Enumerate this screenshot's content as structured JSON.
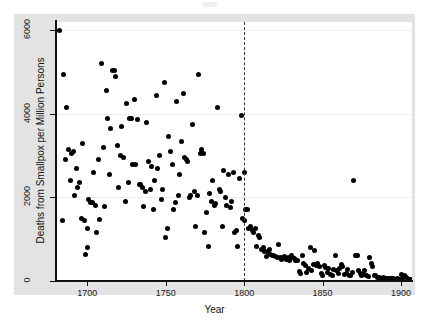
{
  "chart_data": {
    "type": "scatter",
    "title": "",
    "xlabel": "Year",
    "ylabel": "Deaths from Smallpox per Million Persons",
    "xlim": [
      1680,
      1907
    ],
    "ylim": [
      0,
      6200
    ],
    "xticks": [
      1700,
      1750,
      1800,
      1850,
      1900
    ],
    "xticklabels": [
      "1700",
      "1750",
      "1800",
      "1850",
      "1900"
    ],
    "yticks": [
      0,
      2000,
      4000,
      6000
    ],
    "yticklabels": [
      "0",
      "2000",
      "4000",
      "6000"
    ],
    "grid": "horizontal-only",
    "legend": "none",
    "marker": {
      "shape": "circle",
      "color": "#000000",
      "size": 5
    },
    "annotations": [
      {
        "type": "vline",
        "x": 1800,
        "style": "dashed",
        "color": "#333333",
        "label": ""
      }
    ],
    "points": [
      [
        1682,
        6000
      ],
      [
        1684,
        1450
      ],
      [
        1685,
        4950
      ],
      [
        1686,
        2900
      ],
      [
        1687,
        4150
      ],
      [
        1688,
        3150
      ],
      [
        1689,
        2400
      ],
      [
        1690,
        3050
      ],
      [
        1691,
        3100
      ],
      [
        1692,
        2050
      ],
      [
        1693,
        2700
      ],
      [
        1694,
        2250
      ],
      [
        1695,
        2350
      ],
      [
        1696,
        1500
      ],
      [
        1697,
        3300
      ],
      [
        1698,
        1450
      ],
      [
        1699,
        640
      ],
      [
        1700,
        1250
      ],
      [
        1700,
        810
      ],
      [
        1701,
        1950
      ],
      [
        1702,
        1880
      ],
      [
        1703,
        1880
      ],
      [
        1704,
        2600
      ],
      [
        1705,
        1800
      ],
      [
        1706,
        1150
      ],
      [
        1707,
        2900
      ],
      [
        1708,
        1480
      ],
      [
        1709,
        5200
      ],
      [
        1710,
        3200
      ],
      [
        1711,
        1780
      ],
      [
        1712,
        4550
      ],
      [
        1713,
        3900
      ],
      [
        1714,
        2550
      ],
      [
        1715,
        3650
      ],
      [
        1716,
        5050
      ],
      [
        1717,
        5050
      ],
      [
        1718,
        4900
      ],
      [
        1719,
        3250
      ],
      [
        1720,
        2250
      ],
      [
        1721,
        3000
      ],
      [
        1722,
        3700
      ],
      [
        1723,
        2950
      ],
      [
        1724,
        1900
      ],
      [
        1725,
        4250
      ],
      [
        1726,
        2350
      ],
      [
        1727,
        3900
      ],
      [
        1728,
        3900
      ],
      [
        1729,
        2800
      ],
      [
        1730,
        4350
      ],
      [
        1731,
        2800
      ],
      [
        1732,
        3870
      ],
      [
        1733,
        2300
      ],
      [
        1734,
        2300
      ],
      [
        1735,
        2250
      ],
      [
        1736,
        1780
      ],
      [
        1737,
        2150
      ],
      [
        1738,
        3800
      ],
      [
        1739,
        2850
      ],
      [
        1740,
        2200
      ],
      [
        1741,
        2750
      ],
      [
        1742,
        1700
      ],
      [
        1743,
        2400
      ],
      [
        1744,
        4450
      ],
      [
        1745,
        2700
      ],
      [
        1746,
        3000
      ],
      [
        1747,
        1950
      ],
      [
        1748,
        2200
      ],
      [
        1749,
        4750
      ],
      [
        1750,
        1050
      ],
      [
        1751,
        1250
      ],
      [
        1752,
        3450
      ],
      [
        1753,
        3100
      ],
      [
        1754,
        2800
      ],
      [
        1755,
        1720
      ],
      [
        1756,
        1880
      ],
      [
        1757,
        4300
      ],
      [
        1758,
        2050
      ],
      [
        1759,
        2550
      ],
      [
        1760,
        3350
      ],
      [
        1761,
        4500
      ],
      [
        1762,
        2950
      ],
      [
        1763,
        2900
      ],
      [
        1764,
        2850
      ],
      [
        1765,
        2000
      ],
      [
        1766,
        2050
      ],
      [
        1767,
        3750
      ],
      [
        1768,
        2150
      ],
      [
        1769,
        1300
      ],
      [
        1770,
        2050
      ],
      [
        1771,
        4950
      ],
      [
        1772,
        3050
      ],
      [
        1773,
        3150
      ],
      [
        1774,
        3050
      ],
      [
        1775,
        1150
      ],
      [
        1776,
        1650
      ],
      [
        1777,
        820
      ],
      [
        1778,
        2100
      ],
      [
        1779,
        1900
      ],
      [
        1780,
        2400
      ],
      [
        1781,
        1800
      ],
      [
        1782,
        1850
      ],
      [
        1783,
        4150
      ],
      [
        1784,
        2200
      ],
      [
        1785,
        2150
      ],
      [
        1786,
        1300
      ],
      [
        1787,
        2650
      ],
      [
        1788,
        2000
      ],
      [
        1789,
        1800
      ],
      [
        1790,
        2550
      ],
      [
        1791,
        1750
      ],
      [
        1792,
        1900
      ],
      [
        1793,
        2600
      ],
      [
        1794,
        1150
      ],
      [
        1795,
        1200
      ],
      [
        1796,
        820
      ],
      [
        1797,
        2450
      ],
      [
        1798,
        3950
      ],
      [
        1799,
        1500
      ],
      [
        1800,
        2600
      ],
      [
        1800,
        1450
      ],
      [
        1801,
        1700
      ],
      [
        1802,
        1720
      ],
      [
        1803,
        1250
      ],
      [
        1804,
        1300
      ],
      [
        1805,
        1200
      ],
      [
        1806,
        1150
      ],
      [
        1807,
        1250
      ],
      [
        1808,
        820
      ],
      [
        1809,
        1100
      ],
      [
        1810,
        1050
      ],
      [
        1811,
        760
      ],
      [
        1812,
        800
      ],
      [
        1813,
        700
      ],
      [
        1814,
        580
      ],
      [
        1815,
        700
      ],
      [
        1816,
        760
      ],
      [
        1817,
        640
      ],
      [
        1818,
        620
      ],
      [
        1819,
        600
      ],
      [
        1820,
        580
      ],
      [
        1821,
        560
      ],
      [
        1822,
        880
      ],
      [
        1823,
        560
      ],
      [
        1824,
        520
      ],
      [
        1825,
        560
      ],
      [
        1826,
        580
      ],
      [
        1827,
        520
      ],
      [
        1828,
        560
      ],
      [
        1829,
        480
      ],
      [
        1830,
        600
      ],
      [
        1831,
        560
      ],
      [
        1832,
        540
      ],
      [
        1833,
        500
      ],
      [
        1834,
        480
      ],
      [
        1835,
        220
      ],
      [
        1836,
        180
      ],
      [
        1837,
        620
      ],
      [
        1838,
        420
      ],
      [
        1839,
        380
      ],
      [
        1840,
        200
      ],
      [
        1841,
        300
      ],
      [
        1842,
        790
      ],
      [
        1843,
        240
      ],
      [
        1844,
        400
      ],
      [
        1845,
        720
      ],
      [
        1846,
        380
      ],
      [
        1847,
        420
      ],
      [
        1848,
        340
      ],
      [
        1849,
        180
      ],
      [
        1850,
        130
      ],
      [
        1851,
        360
      ],
      [
        1852,
        330
      ],
      [
        1853,
        210
      ],
      [
        1854,
        300
      ],
      [
        1855,
        160
      ],
      [
        1856,
        120
      ],
      [
        1857,
        280
      ],
      [
        1858,
        620
      ],
      [
        1859,
        260
      ],
      [
        1860,
        180
      ],
      [
        1861,
        300
      ],
      [
        1862,
        400
      ],
      [
        1863,
        340
      ],
      [
        1864,
        160
      ],
      [
        1865,
        180
      ],
      [
        1866,
        280
      ],
      [
        1867,
        140
      ],
      [
        1868,
        120
      ],
      [
        1869,
        200
      ],
      [
        1870,
        2400
      ],
      [
        1871,
        620
      ],
      [
        1872,
        600
      ],
      [
        1873,
        250
      ],
      [
        1874,
        180
      ],
      [
        1875,
        120
      ],
      [
        1876,
        160
      ],
      [
        1877,
        240
      ],
      [
        1878,
        120
      ],
      [
        1879,
        100
      ],
      [
        1880,
        560
      ],
      [
        1881,
        420
      ],
      [
        1882,
        350
      ],
      [
        1883,
        140
      ],
      [
        1884,
        120
      ],
      [
        1885,
        90
      ],
      [
        1886,
        80
      ],
      [
        1887,
        70
      ],
      [
        1888,
        60
      ],
      [
        1889,
        80
      ],
      [
        1890,
        60
      ],
      [
        1891,
        60
      ],
      [
        1892,
        50
      ],
      [
        1893,
        60
      ],
      [
        1894,
        50
      ],
      [
        1895,
        60
      ],
      [
        1896,
        40
      ],
      [
        1897,
        40
      ],
      [
        1898,
        50
      ],
      [
        1899,
        40
      ],
      [
        1900,
        160
      ],
      [
        1901,
        60
      ],
      [
        1902,
        140
      ],
      [
        1903,
        100
      ],
      [
        1904,
        60
      ],
      [
        1905,
        40
      ],
      [
        1906,
        40
      ]
    ]
  },
  "figure": {
    "background_color": "#e3e3e3",
    "plot_background_color": "#ffffff",
    "axis_color": "#111111",
    "gridline_color": "#ededed",
    "marker_color": "#000000",
    "vline_color": "#333333"
  }
}
